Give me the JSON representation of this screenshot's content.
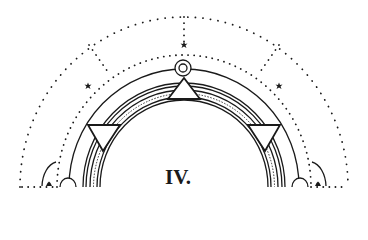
{
  "diagram": {
    "label": "IV.",
    "colors": {
      "ink": "#1a1a1a",
      "background": "#ffffff"
    },
    "elements": {
      "outer_dotted_arc": "dotted semicircle with small radial dotted spokes",
      "inner_dotted_arc": "dotted semicircle",
      "stars": [
        "star-top",
        "star-left",
        "star-right",
        "star-bottom-left",
        "star-bottom-right"
      ],
      "solid_arc": "single solid semicircle",
      "ring_band": "multi-line concentric band with one dashed line",
      "triangles": [
        "triangle-top (apex up)",
        "triangle-left (apex down)",
        "triangle-right (apex down)"
      ],
      "top_circle": "double circle at apex",
      "base_semicircles": [
        "left small semicircle",
        "right small semicircle"
      ],
      "corner_arcs": [
        "left quarter arc",
        "right quarter arc"
      ]
    }
  }
}
